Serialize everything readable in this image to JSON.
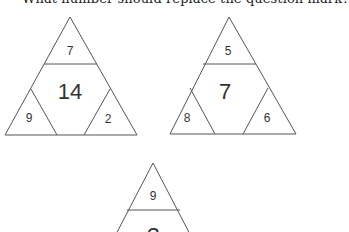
{
  "prompt": "What number should replace the question mark?",
  "puzzles": [
    {
      "top": "7",
      "center": "14",
      "left": "9",
      "right": "2"
    },
    {
      "top": "5",
      "center": "7",
      "left": "8",
      "right": "6"
    },
    {
      "top": "9",
      "center": "?",
      "left": "",
      "right": ""
    }
  ],
  "colors": {
    "line": "#555555",
    "text": "#333333",
    "background": "#ffffff"
  }
}
